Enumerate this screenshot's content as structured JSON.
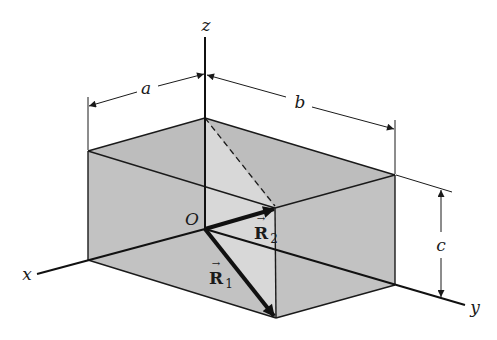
{
  "figure": {
    "colors": {
      "background": "#ffffff",
      "box_face_dark": "#bdbdbd",
      "box_face_light": "#d6d6d6",
      "line": "#1a1a1a"
    }
  },
  "labels": {
    "z_axis": "z",
    "x_axis": "x",
    "y_axis": "y",
    "origin": "O",
    "dim_a": "a",
    "dim_b": "b",
    "dim_c": "c",
    "vector_r1": "R",
    "vector_r1_sub": "1",
    "vector_r2": "R",
    "vector_r2_sub": "2",
    "vector_arrow": "→"
  }
}
